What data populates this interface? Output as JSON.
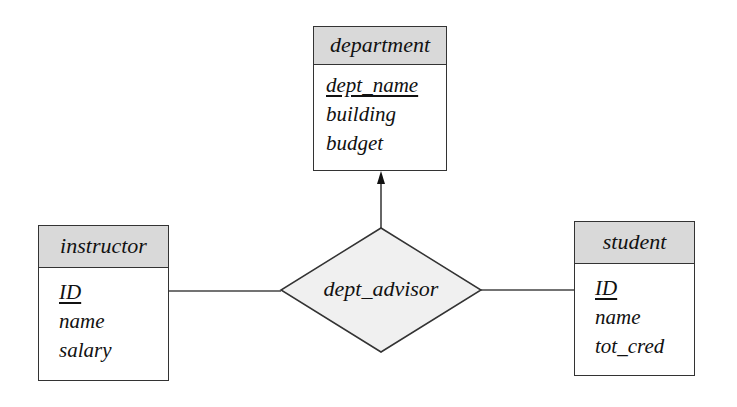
{
  "diagram": {
    "type": "er-diagram",
    "entities": [
      {
        "id": "department",
        "name": "department",
        "attributes": [
          {
            "name": "dept_name",
            "primary_key": true
          },
          {
            "name": "building",
            "primary_key": false
          },
          {
            "name": "budget",
            "primary_key": false
          }
        ]
      },
      {
        "id": "instructor",
        "name": "instructor",
        "attributes": [
          {
            "name": "ID",
            "primary_key": true
          },
          {
            "name": "name",
            "primary_key": false
          },
          {
            "name": "salary",
            "primary_key": false
          }
        ]
      },
      {
        "id": "student",
        "name": "student",
        "attributes": [
          {
            "name": "ID",
            "primary_key": true
          },
          {
            "name": "name",
            "primary_key": false
          },
          {
            "name": "tot_cred",
            "primary_key": false
          }
        ]
      }
    ],
    "relationship": {
      "name": "dept_advisor",
      "connections": [
        {
          "entity": "instructor",
          "cardinality": "many",
          "arrow": false
        },
        {
          "entity": "student",
          "cardinality": "many",
          "arrow": false
        },
        {
          "entity": "department",
          "cardinality": "one",
          "arrow": true
        }
      ]
    },
    "colors": {
      "header_fill": "#d9d9d9",
      "relationship_fill": "#f0f0f0",
      "stroke": "#333333"
    }
  }
}
